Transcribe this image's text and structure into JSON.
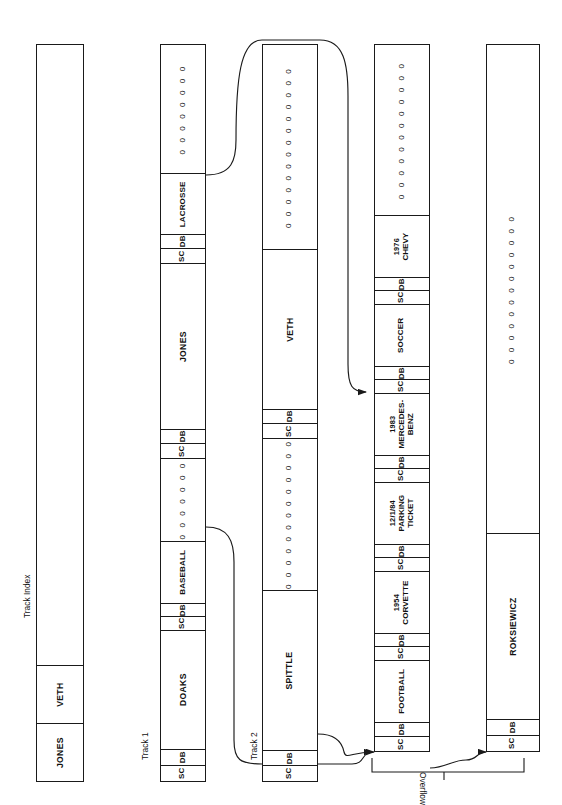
{
  "diagram": {
    "captions": {
      "track_index": "Track Index",
      "track_1": "Track 1",
      "track_2": "Track 2",
      "overflow": "Overflow"
    },
    "labels": {
      "sc": "SC",
      "db": "DB",
      "zeros_char": "0"
    },
    "colors": {
      "ink": "#1a1a1a",
      "background": "#ffffff"
    }
  },
  "columns": [
    {
      "id": "track-index",
      "name": "Track Index",
      "caption": "Track Index",
      "cells": [
        {
          "kind": "name",
          "text": "JONES"
        },
        {
          "kind": "name",
          "text": "VETH"
        },
        {
          "kind": "blank",
          "text": ""
        }
      ]
    },
    {
      "id": "track-1",
      "name": "Track 1",
      "caption": "Track 1",
      "cells": [
        {
          "kind": "sc",
          "text": "SC"
        },
        {
          "kind": "db",
          "text": "DB"
        },
        {
          "kind": "name",
          "text": "DOAKS"
        },
        {
          "kind": "sc",
          "text": "SC"
        },
        {
          "kind": "db",
          "text": "DB"
        },
        {
          "kind": "rec",
          "text": "BASEBALL"
        },
        {
          "kind": "zeros",
          "text": "0 0 0 0 0 0 0"
        },
        {
          "kind": "sc",
          "text": "SC"
        },
        {
          "kind": "db",
          "text": "DB"
        },
        {
          "kind": "name",
          "text": "JONES"
        },
        {
          "kind": "sc",
          "text": "SC"
        },
        {
          "kind": "db",
          "text": "DB"
        },
        {
          "kind": "rec",
          "text": "LACROSSE"
        },
        {
          "kind": "zeros",
          "text": "0 0 0 0 0 0 0 0"
        }
      ]
    },
    {
      "id": "track-2",
      "name": "Track 2",
      "caption": "Track 2",
      "cells": [
        {
          "kind": "sc",
          "text": "SC"
        },
        {
          "kind": "db",
          "text": "DB"
        },
        {
          "kind": "name",
          "text": "SPITTLE"
        },
        {
          "kind": "zeros",
          "text": "0 0 0 0 0 0 0 0 0 0 0 0 0"
        },
        {
          "kind": "sc",
          "text": "SC"
        },
        {
          "kind": "db",
          "text": "DB"
        },
        {
          "kind": "name",
          "text": "VETH"
        },
        {
          "kind": "zeros",
          "text": "0 0 0 0 0 0 0 0 0 0 0 0 0 0"
        }
      ]
    },
    {
      "id": "overflow-1",
      "name": "Overflow track 1",
      "caption": "",
      "cells": [
        {
          "kind": "sc",
          "text": "SC"
        },
        {
          "kind": "db",
          "text": "DB"
        },
        {
          "kind": "rec",
          "text": "FOOTBALL"
        },
        {
          "kind": "sc",
          "text": "SC"
        },
        {
          "kind": "db",
          "text": "DB"
        },
        {
          "kind": "rec2",
          "year": "1954",
          "text": "CORVETTE"
        },
        {
          "kind": "sc",
          "text": "SC"
        },
        {
          "kind": "db",
          "text": "DB"
        },
        {
          "kind": "rec2",
          "year": "12/1/84",
          "text": "PARKING\nTICKET"
        },
        {
          "kind": "sc",
          "text": "SC"
        },
        {
          "kind": "db",
          "text": "DB"
        },
        {
          "kind": "rec2",
          "year": "1983",
          "text": "MERCEDES-\nBENZ"
        },
        {
          "kind": "sc",
          "text": "SC"
        },
        {
          "kind": "db",
          "text": "DB"
        },
        {
          "kind": "rec",
          "text": "SOCCER"
        },
        {
          "kind": "sc",
          "text": "SC"
        },
        {
          "kind": "db",
          "text": "DB"
        },
        {
          "kind": "rec2",
          "year": "1976",
          "text": "CHEVY"
        },
        {
          "kind": "zeros",
          "text": "0 0 0 0 0 0 0 0 0 0 0 0"
        }
      ]
    },
    {
      "id": "overflow-2",
      "name": "Overflow track 2",
      "caption": "",
      "cells": [
        {
          "kind": "sc",
          "text": "SC"
        },
        {
          "kind": "db",
          "text": "DB"
        },
        {
          "kind": "name",
          "text": "ROKSIEWICZ"
        },
        {
          "kind": "zeros",
          "text": "0 0 0 0 0 0 0 0 0 0 0 0 0"
        }
      ]
    }
  ],
  "connectors": [
    {
      "id": "baseball-to-overflow-1",
      "from": "track-1.BASEBALL",
      "to": "overflow-1"
    },
    {
      "id": "lacrosse-to-overflow-1",
      "from": "track-1.LACROSSE",
      "to": "overflow-1"
    },
    {
      "id": "spittle-to-overflow-1",
      "from": "track-2.SPITTLE",
      "to": "overflow-1"
    },
    {
      "id": "veth-to-overflow-2",
      "from": "track-2.VETH",
      "to": "overflow-2"
    }
  ]
}
